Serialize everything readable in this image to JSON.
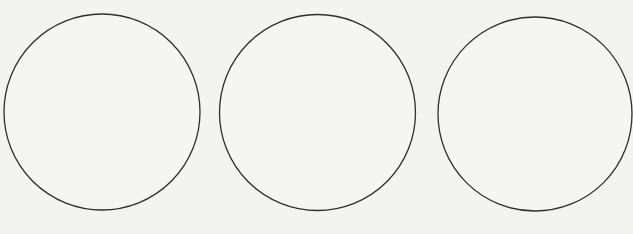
{
  "figure": {
    "stroke_color": "#2e2e2e",
    "background_color": "#f3f3f2",
    "shapes": [
      {
        "name": "circle-left",
        "type": "circle",
        "filled": false
      },
      {
        "name": "circle-middle",
        "type": "circle",
        "filled": false
      },
      {
        "name": "circle-right",
        "type": "circle",
        "filled": false
      }
    ]
  }
}
